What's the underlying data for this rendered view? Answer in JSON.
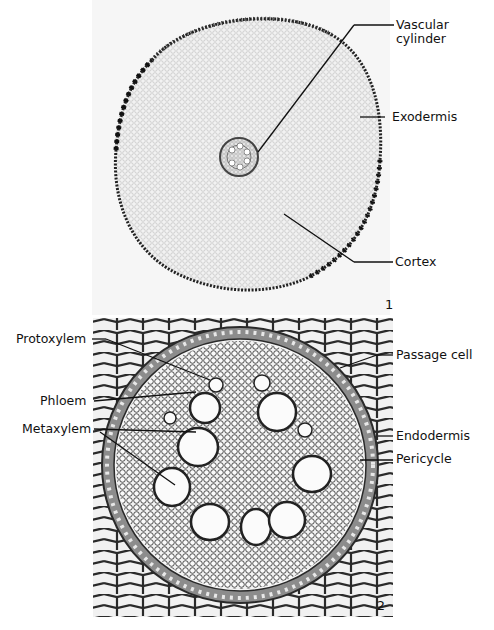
{
  "figure": {
    "panels": [
      {
        "number": "1",
        "description": "Low-magnification root cross section",
        "labels": {
          "vascular_cylinder": "Vascular\ncylinder",
          "vascular_cylinder_line1": "Vascular",
          "vascular_cylinder_line2": "cylinder",
          "exodermis": "Exodermis",
          "cortex": "Cortex"
        }
      },
      {
        "number": "2",
        "description": "High-magnification vascular cylinder",
        "labels": {
          "protoxylem": "Protoxylem",
          "phloem": "Phloem",
          "metaxylem": "Metaxylem",
          "passage_cell": "Passage cell",
          "endodermis": "Endodermis",
          "pericycle": "Pericycle"
        }
      }
    ]
  }
}
